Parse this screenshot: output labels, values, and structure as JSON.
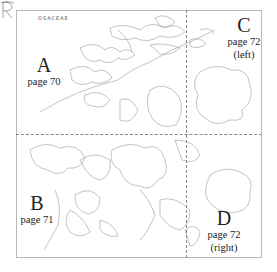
{
  "diagram": {
    "title_initial": "R",
    "title_rest": "OSACEAE",
    "sections": [
      {
        "letter": "A",
        "page": "page 70",
        "note": ""
      },
      {
        "letter": "B",
        "page": "page 71",
        "note": ""
      },
      {
        "letter": "C",
        "page": "page 72",
        "note": "(left)"
      },
      {
        "letter": "D",
        "page": "page 72",
        "note": "(right)"
      }
    ],
    "colors": {
      "line": "#888888",
      "border": "#b8b8b8",
      "text": "#222222"
    }
  }
}
